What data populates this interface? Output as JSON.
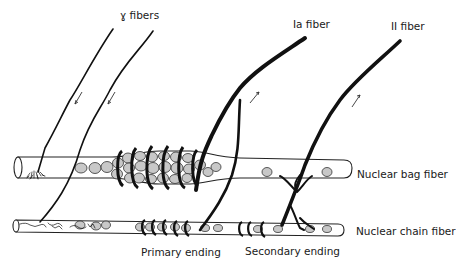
{
  "diagram": {
    "labels": {
      "gamma_fibers": "ɣ fibers",
      "ia_fiber": "Ia fiber",
      "ii_fiber": "II fiber",
      "nuclear_bag_fiber": "Nuclear bag fiber",
      "nuclear_chain_fiber": "Nuclear chain fiber",
      "primary_ending": "Primary ending",
      "secondary_ending": "Secondary ending"
    },
    "components": [
      {
        "name": "gamma-motor-fibers",
        "count": 2,
        "direction": "efferent (arrows toward spindle)"
      },
      {
        "name": "ia-afferent-fiber",
        "direction": "afferent (arrow away from spindle)",
        "ending": "Primary ending (annulospiral)"
      },
      {
        "name": "ii-afferent-fiber",
        "direction": "afferent (arrow away from spindle)",
        "ending": "Secondary ending"
      },
      {
        "name": "nuclear-bag-fiber"
      },
      {
        "name": "nuclear-chain-fiber"
      }
    ],
    "colors": {
      "ink": "#111111",
      "nuclei": "#c8c8c8",
      "background": "#ffffff"
    }
  }
}
